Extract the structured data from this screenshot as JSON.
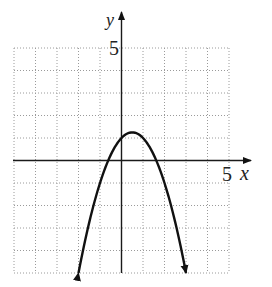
{
  "chart_data": {
    "type": "line",
    "title": "",
    "xlabel": "x",
    "ylabel": "y",
    "xlim": [
      -5,
      5
    ],
    "ylim": [
      -5,
      5
    ],
    "grid": true,
    "grid_step": 1,
    "tick_labels": {
      "x": [
        "5"
      ],
      "y": [
        "5"
      ]
    },
    "series": [
      {
        "name": "parabola",
        "equation": "y = -x^2 + x + 1",
        "vertex": [
          0.5,
          1.25
        ],
        "y_intercept": 1,
        "x_intercepts": [
          -0.618,
          1.618
        ],
        "arrow_ends": [
          [
            -2,
            -5
          ],
          [
            3,
            -5
          ]
        ],
        "x": [
          -2,
          -1.5,
          -1,
          -0.5,
          0,
          0.5,
          1,
          1.5,
          2,
          2.5,
          3
        ],
        "y": [
          -5,
          -2.75,
          -1,
          0.25,
          1,
          1.25,
          1,
          0.25,
          -1,
          -2.75,
          -5
        ]
      }
    ]
  },
  "labels": {
    "x_axis": "x",
    "y_axis": "y",
    "x_tick": "5",
    "y_tick": "5"
  }
}
